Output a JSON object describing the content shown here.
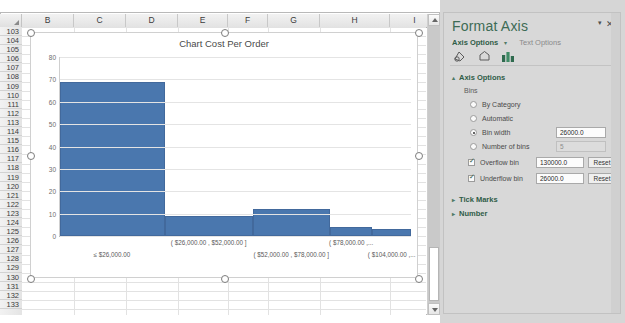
{
  "spreadsheet": {
    "columns": [
      "B",
      "C",
      "D",
      "E",
      "F",
      "G",
      "H",
      "I"
    ],
    "rows": [
      103,
      104,
      105,
      106,
      107,
      108,
      109,
      110,
      111,
      112,
      113,
      114,
      115,
      116,
      117,
      118,
      119,
      120,
      121,
      122,
      123,
      124,
      125,
      126,
      127,
      128,
      129,
      130,
      131,
      132,
      133
    ],
    "select_all_icon": "select-all-corner"
  },
  "chart_data": {
    "type": "bar",
    "title": "Chart Cost Per Order",
    "xlabel": "",
    "ylabel": "",
    "ylim": [
      0,
      80
    ],
    "yticks": [
      0,
      10,
      20,
      30,
      40,
      50,
      60,
      70,
      80
    ],
    "grid": true,
    "legend": "none",
    "categories": [
      "≤ $26,000.00",
      "( $26,000.00 ,  $52,000.00 ]",
      "( $52,000.00 ,  $78,000.00 ]",
      "( $78,000.00 ,...",
      "( $104,000.00 ,..."
    ],
    "values": [
      69,
      9,
      12,
      4,
      3
    ],
    "series": [
      {
        "name": "Cost Per Order",
        "values": [
          69,
          9,
          12,
          4,
          3
        ]
      }
    ],
    "bar_color": "#4A77AE",
    "bar_widths_pct": [
      30,
      25,
      22,
      12,
      11
    ]
  },
  "pane": {
    "title": "Format Axis",
    "close_icon": "close-icon",
    "caret_icon": "chevron-down-icon",
    "tabs": {
      "active": "Axis Options",
      "active_caret": "▾",
      "inactive": "Text Options"
    },
    "icon_buttons": [
      {
        "name": "fill-line-icon",
        "label": "Fill & Line"
      },
      {
        "name": "effects-icon",
        "label": "Effects"
      },
      {
        "name": "axis-options-icon",
        "label": "Axis Options"
      }
    ],
    "sections": {
      "axis_options": {
        "label": "Axis Options",
        "expanded_arrow": "▴",
        "bins_label": "Bins",
        "options": [
          {
            "name": "by-category",
            "label": "By Category",
            "type": "radio",
            "checked": false
          },
          {
            "name": "automatic",
            "label": "Automatic",
            "type": "radio",
            "checked": false
          },
          {
            "name": "bin-width",
            "label": "Bin width",
            "type": "radio",
            "checked": true,
            "value": "26000.0"
          },
          {
            "name": "number-of-bins",
            "label": "Number of bins",
            "type": "radio",
            "checked": false,
            "value": "5",
            "disabled": true
          },
          {
            "name": "overflow-bin",
            "label": "Overflow bin",
            "type": "checkbox",
            "checked": true,
            "value": "130000.0",
            "reset": "Reset"
          },
          {
            "name": "underflow-bin",
            "label": "Underflow bin",
            "type": "checkbox",
            "checked": true,
            "value": "26000.0",
            "reset": "Reset"
          }
        ]
      },
      "tick_marks": {
        "label": "Tick Marks",
        "collapsed_arrow": "▸"
      },
      "number": {
        "label": "Number",
        "collapsed_arrow": "▸"
      }
    }
  },
  "colors": {
    "accent": "#4A77AE",
    "pane_title": "#3d6b55",
    "pane_bg": "#d8d8d8"
  }
}
